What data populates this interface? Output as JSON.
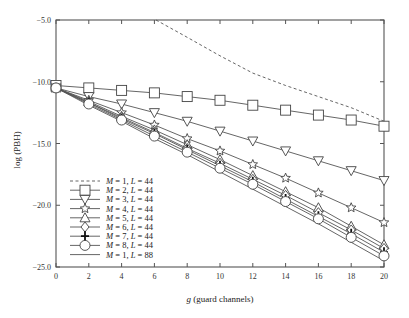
{
  "chart_data": {
    "type": "line",
    "title": "",
    "xlabel": "g (guard channels)",
    "xlabel_italic": "g",
    "xlabel_rest": " (guard channels)",
    "ylabel": "log (PBH)",
    "xlim": [
      0,
      20
    ],
    "ylim": [
      -25.0,
      -5.0
    ],
    "xticks": [
      0,
      2,
      4,
      6,
      8,
      10,
      12,
      14,
      16,
      18,
      20
    ],
    "yticks": [
      -5.0,
      -10.0,
      -15.0,
      -20.0,
      -25.0
    ],
    "ytick_labels": [
      "-5.0",
      "-10.0",
      "-15.0",
      "-20.0",
      "-25.0"
    ],
    "grid": false,
    "legend_position": "lower left",
    "x": [
      0,
      2,
      4,
      6,
      8,
      10,
      12,
      14,
      16,
      18,
      20
    ],
    "series": [
      {
        "name": "M = 1, L = 44",
        "m": "1",
        "l": "44",
        "style": "dashed",
        "marker": "none",
        "x": [
          6.1,
          8,
          10,
          12,
          14,
          16,
          18,
          20
        ],
        "values": [
          -5.0,
          -6.4,
          -7.9,
          -9.3,
          -10.3,
          -11.2,
          -12.1,
          -13.2
        ]
      },
      {
        "name": "M = 2, L = 44",
        "m": "2",
        "l": "44",
        "style": "solid",
        "marker": "square",
        "values": [
          -10.3,
          -10.5,
          -10.7,
          -10.9,
          -11.2,
          -11.5,
          -11.9,
          -12.3,
          -12.7,
          -13.1,
          -13.6
        ]
      },
      {
        "name": "M = 3, L = 44",
        "m": "3",
        "l": "44",
        "style": "solid",
        "marker": "triangle-down",
        "values": [
          -10.5,
          -11.2,
          -11.8,
          -12.5,
          -13.2,
          -14.0,
          -14.8,
          -15.6,
          -16.4,
          -17.2,
          -18.0
        ]
      },
      {
        "name": "M = 4, L = 44",
        "m": "4",
        "l": "44",
        "style": "solid",
        "marker": "star",
        "values": [
          -10.5,
          -11.5,
          -12.5,
          -13.5,
          -14.6,
          -15.6,
          -16.7,
          -17.8,
          -19.0,
          -20.2,
          -21.4
        ]
      },
      {
        "name": "M = 5, L = 44",
        "m": "5",
        "l": "44",
        "style": "solid",
        "marker": "triangle-up",
        "values": [
          -10.5,
          -11.6,
          -12.8,
          -13.9,
          -15.1,
          -16.3,
          -17.6,
          -18.9,
          -20.2,
          -21.7,
          -23.2
        ]
      },
      {
        "name": "M = 6, L = 44",
        "m": "6",
        "l": "44",
        "style": "solid",
        "marker": "diamond",
        "values": [
          -10.5,
          -11.7,
          -12.9,
          -14.1,
          -15.4,
          -16.6,
          -17.9,
          -19.2,
          -20.6,
          -22.0,
          -23.5
        ]
      },
      {
        "name": "M = 7, L = 44",
        "m": "7",
        "l": "44",
        "style": "solid",
        "marker": "plus",
        "values": [
          -10.5,
          -11.7,
          -13.0,
          -14.2,
          -15.5,
          -16.8,
          -18.1,
          -19.5,
          -20.9,
          -22.3,
          -23.8
        ]
      },
      {
        "name": "M = 8, L = 44",
        "m": "8",
        "l": "44",
        "style": "solid",
        "marker": "circle",
        "values": [
          -10.5,
          -11.8,
          -13.1,
          -14.4,
          -15.7,
          -17.0,
          -18.3,
          -19.7,
          -21.1,
          -22.6,
          -24.1
        ]
      },
      {
        "name": "M = 1, L = 88",
        "m": "1",
        "l": "88",
        "style": "solid",
        "marker": "none",
        "values": [
          -10.5,
          -11.9,
          -13.2,
          -14.6,
          -15.9,
          -17.3,
          -18.7,
          -20.1,
          -21.5,
          -23.0,
          -24.5
        ]
      }
    ]
  }
}
